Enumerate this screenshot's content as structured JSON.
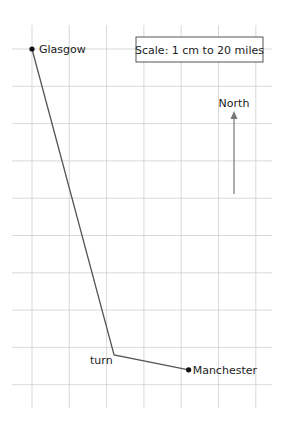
{
  "diagram": {
    "type": "map-route-bearing-diagram",
    "scale_label": "Scale: 1 cm to 20 miles",
    "north_label": "North",
    "places": [
      {
        "name": "Glasgow",
        "grid": [
          0,
          0
        ]
      },
      {
        "name": "turn",
        "grid": [
          2.2,
          8.2
        ]
      },
      {
        "name": "Manchester",
        "grid": [
          4.2,
          8.6
        ]
      }
    ],
    "labels": {
      "glasgow": "Glasgow",
      "turn": "turn",
      "manchester": "Manchester"
    },
    "colors": {
      "grid": "#cfcfcf",
      "route": "#555555",
      "text": "#222222"
    }
  }
}
